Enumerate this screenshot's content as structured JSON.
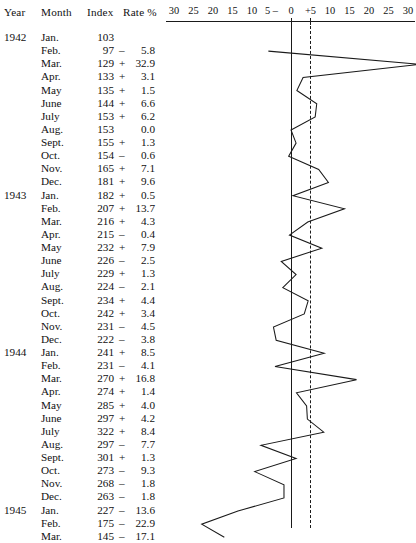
{
  "table": {
    "headers": {
      "year": "Year",
      "month": "Month",
      "index": "Index",
      "rate": "Rate %"
    },
    "rows": [
      {
        "year": "1942",
        "month": "Jan.",
        "index": "103",
        "sign": "",
        "value": "",
        "rate": null
      },
      {
        "year": "",
        "month": "Feb.",
        "index": "97",
        "sign": "–",
        "value": "5.8",
        "rate": -5.8
      },
      {
        "year": "",
        "month": "Mar.",
        "index": "129",
        "sign": "+",
        "value": "32.9",
        "rate": 32.9
      },
      {
        "year": "",
        "month": "Apr.",
        "index": "133",
        "sign": "+",
        "value": "3.1",
        "rate": 3.1
      },
      {
        "year": "",
        "month": "May",
        "index": "135",
        "sign": "+",
        "value": "1.5",
        "rate": 1.5
      },
      {
        "year": "",
        "month": "June",
        "index": "144",
        "sign": "+",
        "value": "6.6",
        "rate": 6.6
      },
      {
        "year": "",
        "month": "July",
        "index": "153",
        "sign": "+",
        "value": "6.2",
        "rate": 6.2
      },
      {
        "year": "",
        "month": "Aug.",
        "index": "153",
        "sign": "",
        "value": "0.0",
        "rate": 0.0
      },
      {
        "year": "",
        "month": "Sept.",
        "index": "155",
        "sign": "+",
        "value": "1.3",
        "rate": 1.3
      },
      {
        "year": "",
        "month": "Oct.",
        "index": "154",
        "sign": "–",
        "value": "0.6",
        "rate": -0.6
      },
      {
        "year": "",
        "month": "Nov.",
        "index": "165",
        "sign": "+",
        "value": "7.1",
        "rate": 7.1
      },
      {
        "year": "",
        "month": "Dec.",
        "index": "181",
        "sign": "+",
        "value": "9.6",
        "rate": 9.6
      },
      {
        "year": "1943",
        "month": "Jan.",
        "index": "182",
        "sign": "+",
        "value": "0.5",
        "rate": 0.5
      },
      {
        "year": "",
        "month": "Feb.",
        "index": "207",
        "sign": "+",
        "value": "13.7",
        "rate": 13.7
      },
      {
        "year": "",
        "month": "Mar.",
        "index": "216",
        "sign": "+",
        "value": "4.3",
        "rate": 4.3
      },
      {
        "year": "",
        "month": "Apr.",
        "index": "215",
        "sign": "–",
        "value": "0.4",
        "rate": -0.4
      },
      {
        "year": "",
        "month": "May",
        "index": "232",
        "sign": "+",
        "value": "7.9",
        "rate": 7.9
      },
      {
        "year": "",
        "month": "June",
        "index": "226",
        "sign": "–",
        "value": "2.5",
        "rate": -2.5
      },
      {
        "year": "",
        "month": "July",
        "index": "229",
        "sign": "+",
        "value": "1.3",
        "rate": 1.3
      },
      {
        "year": "",
        "month": "Aug.",
        "index": "224",
        "sign": "–",
        "value": "2.1",
        "rate": -2.1
      },
      {
        "year": "",
        "month": "Sept.",
        "index": "234",
        "sign": "+",
        "value": "4.4",
        "rate": 4.4
      },
      {
        "year": "",
        "month": "Oct.",
        "index": "242",
        "sign": "+",
        "value": "3.4",
        "rate": 3.4
      },
      {
        "year": "",
        "month": "Nov.",
        "index": "231",
        "sign": "–",
        "value": "4.5",
        "rate": -4.5
      },
      {
        "year": "",
        "month": "Dec.",
        "index": "222",
        "sign": "–",
        "value": "3.8",
        "rate": -3.8
      },
      {
        "year": "1944",
        "month": "Jan.",
        "index": "241",
        "sign": "+",
        "value": "8.5",
        "rate": 8.5
      },
      {
        "year": "",
        "month": "Feb.",
        "index": "231",
        "sign": "–",
        "value": "4.1",
        "rate": -4.1
      },
      {
        "year": "",
        "month": "Mar.",
        "index": "270",
        "sign": "+",
        "value": "16.8",
        "rate": 16.8
      },
      {
        "year": "",
        "month": "Apr.",
        "index": "274",
        "sign": "+",
        "value": "1.4",
        "rate": 1.4
      },
      {
        "year": "",
        "month": "May",
        "index": "285",
        "sign": "+",
        "value": "4.0",
        "rate": 4.0
      },
      {
        "year": "",
        "month": "June",
        "index": "297",
        "sign": "+",
        "value": "4.2",
        "rate": 4.2
      },
      {
        "year": "",
        "month": "July",
        "index": "322",
        "sign": "+",
        "value": "8.4",
        "rate": 8.4
      },
      {
        "year": "",
        "month": "Aug.",
        "index": "297",
        "sign": "–",
        "value": "7.7",
        "rate": -7.7
      },
      {
        "year": "",
        "month": "Sept.",
        "index": "301",
        "sign": "+",
        "value": "1.3",
        "rate": 1.3
      },
      {
        "year": "",
        "month": "Oct.",
        "index": "273",
        "sign": "–",
        "value": "9.3",
        "rate": -9.3
      },
      {
        "year": "",
        "month": "Nov.",
        "index": "268",
        "sign": "–",
        "value": "1.8",
        "rate": -1.8
      },
      {
        "year": "",
        "month": "Dec.",
        "index": "263",
        "sign": "–",
        "value": "1.8",
        "rate": -1.8
      },
      {
        "year": "1945",
        "month": "Jan.",
        "index": "227",
        "sign": "–",
        "value": "13.6",
        "rate": -13.6
      },
      {
        "year": "",
        "month": "Feb.",
        "index": "175",
        "sign": "–",
        "value": "22.9",
        "rate": -22.9
      },
      {
        "year": "",
        "month": "Mar.",
        "index": "145",
        "sign": "–",
        "value": "17.1",
        "rate": -17.1
      }
    ]
  },
  "chart_data": {
    "type": "line",
    "title": "",
    "xlabel": "",
    "ylabel": "",
    "orientation": "vertical-time",
    "grid": false,
    "legend": null,
    "xlim": [
      -30,
      30
    ],
    "axis_ticks": [
      {
        "label": "30",
        "value": -30
      },
      {
        "label": "25",
        "value": -25
      },
      {
        "label": "20",
        "value": -20
      },
      {
        "label": "15",
        "value": -15
      },
      {
        "label": "10",
        "value": -10
      },
      {
        "label": "5 –",
        "value": -5
      },
      {
        "label": "0",
        "value": 0
      },
      {
        "label": "+5",
        "value": 5
      },
      {
        "label": "10",
        "value": 10
      },
      {
        "label": "15",
        "value": 15
      },
      {
        "label": "20",
        "value": 20
      },
      {
        "label": "25",
        "value": 25
      },
      {
        "label": "30",
        "value": 30
      }
    ],
    "reference_line": 5,
    "zero_line": 0,
    "categories": [
      "1942 Jan.",
      "1942 Feb.",
      "1942 Mar.",
      "1942 Apr.",
      "1942 May",
      "1942 June",
      "1942 July",
      "1942 Aug.",
      "1942 Sept.",
      "1942 Oct.",
      "1942 Nov.",
      "1942 Dec.",
      "1943 Jan.",
      "1943 Feb.",
      "1943 Mar.",
      "1943 Apr.",
      "1943 May",
      "1943 June",
      "1943 July",
      "1943 Aug.",
      "1943 Sept.",
      "1943 Oct.",
      "1943 Nov.",
      "1943 Dec.",
      "1944 Jan.",
      "1944 Feb.",
      "1944 Mar.",
      "1944 Apr.",
      "1944 May",
      "1944 June",
      "1944 July",
      "1944 Aug.",
      "1944 Sept.",
      "1944 Oct.",
      "1944 Nov.",
      "1944 Dec.",
      "1945 Jan.",
      "1945 Feb.",
      "1945 Mar."
    ],
    "values": [
      null,
      -5.8,
      32.9,
      3.1,
      1.5,
      6.6,
      6.2,
      0.0,
      1.3,
      -0.6,
      7.1,
      9.6,
      0.5,
      13.7,
      4.3,
      -0.4,
      7.9,
      -2.5,
      1.3,
      -2.1,
      4.4,
      3.4,
      -4.5,
      -3.8,
      8.5,
      -4.1,
      16.8,
      1.4,
      4.0,
      4.2,
      8.4,
      -7.7,
      1.3,
      -9.3,
      -1.8,
      -1.8,
      -13.6,
      -22.9,
      -17.1
    ],
    "index_series": [
      103,
      97,
      129,
      133,
      135,
      144,
      153,
      153,
      155,
      154,
      165,
      181,
      182,
      207,
      216,
      215,
      232,
      226,
      229,
      224,
      234,
      242,
      231,
      222,
      241,
      231,
      270,
      274,
      285,
      297,
      322,
      297,
      301,
      273,
      268,
      263,
      227,
      175,
      145
    ],
    "line_color": "#1a1a1a"
  }
}
